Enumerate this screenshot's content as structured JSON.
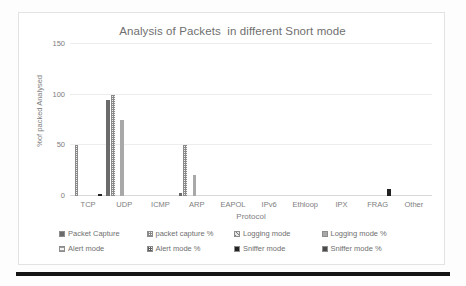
{
  "chart_data": {
    "type": "bar",
    "title": "Analysis of Packets  in different Snort mode",
    "xlabel": "Protocol",
    "ylabel": "%of packed Analysed",
    "ylim": [
      0,
      150
    ],
    "yticks": [
      0,
      50,
      100,
      150
    ],
    "ytick_labels": [
      "0",
      "50",
      "100",
      "150"
    ],
    "grid": true,
    "legend_position": "bottom",
    "categories": [
      "TCP",
      "UDP",
      "ICMP",
      "ARP",
      "EAPOL",
      "IPv6",
      "Ethloop",
      "IPX",
      "FRAG",
      "Other"
    ],
    "series": [
      {
        "name": "Packet Capture",
        "values": [
          0,
          95,
          0,
          3,
          0,
          0,
          0,
          0,
          0,
          0
        ]
      },
      {
        "name": "packet capture %",
        "values": [
          50,
          100,
          0,
          50,
          0,
          0,
          0,
          0,
          0,
          0
        ]
      },
      {
        "name": "Logging mode",
        "values": [
          0,
          0,
          0,
          0,
          0,
          0,
          0,
          0,
          0,
          0
        ]
      },
      {
        "name": "Logging mode %",
        "values": [
          0,
          75,
          0,
          21,
          0,
          0,
          0,
          0,
          0,
          0
        ]
      },
      {
        "name": "Alert mode",
        "values": [
          0,
          0,
          0,
          0,
          0,
          0,
          0,
          0,
          0,
          0
        ]
      },
      {
        "name": "Alert mode %",
        "values": [
          0,
          0,
          0,
          0,
          0,
          0,
          0,
          0,
          0,
          0
        ]
      },
      {
        "name": "Sniffer mode",
        "values": [
          2,
          0,
          0,
          0,
          0,
          0,
          0,
          0,
          7,
          0
        ]
      },
      {
        "name": "Sniffer mode %",
        "values": [
          0,
          0,
          0,
          0,
          0,
          0,
          0,
          0,
          0,
          0
        ]
      }
    ]
  },
  "legend": {
    "rows": [
      [
        "Packet Capture",
        "packet capture %",
        "Logging mode",
        "Logging mode %"
      ],
      [
        "Alert mode",
        "Alert mode %",
        "Sniffer mode",
        "Sniffer mode %"
      ]
    ]
  }
}
